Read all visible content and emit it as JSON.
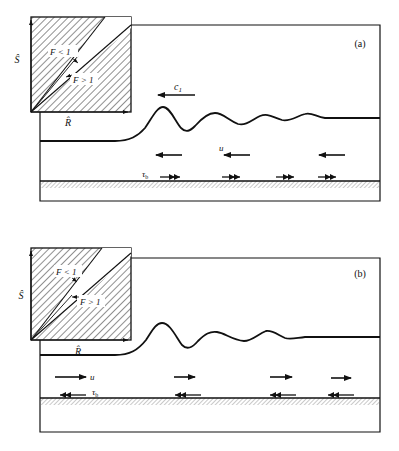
{
  "figure": {
    "panels": [
      {
        "id": "a",
        "label": "(a)",
        "inset": {
          "y_axis": "Ŝ",
          "x_axis": "R̂",
          "region_upper": "F < 1",
          "region_lower": "F > 1"
        },
        "wave_speed_label": "c",
        "wave_speed_subscript": "1",
        "velocity_label": "u",
        "velocity_direction": "left",
        "bed_stress_label": "τ",
        "bed_stress_subscript": "b",
        "bed_stress_direction": "right"
      },
      {
        "id": "b",
        "label": "(b)",
        "inset": {
          "y_axis": "Ŝ",
          "x_axis": "R̂",
          "region_upper": "F < 1",
          "region_lower": "F > 1"
        },
        "velocity_label": "u",
        "velocity_direction": "right",
        "bed_stress_label": "τ",
        "bed_stress_subscript": "b",
        "bed_stress_direction": "left"
      }
    ]
  }
}
